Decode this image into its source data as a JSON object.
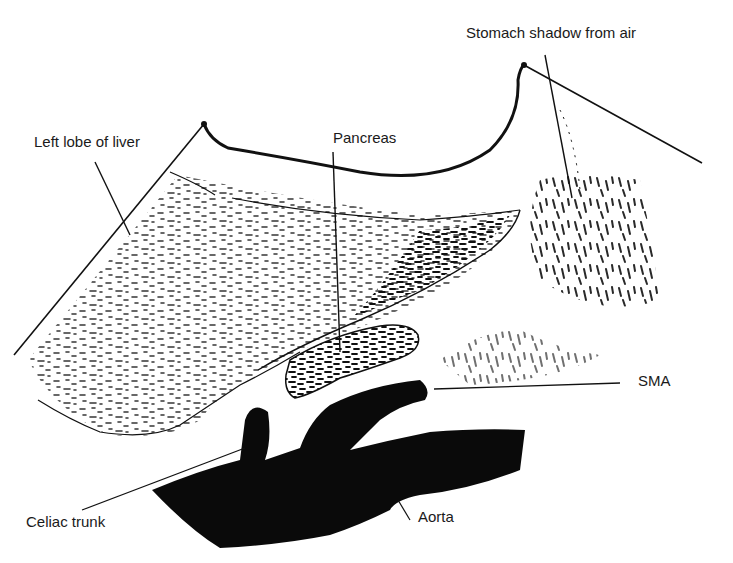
{
  "diagram": {
    "type": "ultrasound-anatomy-sketch",
    "labels": {
      "stomach": "Stomach shadow from air",
      "liver": "Left lobe of liver",
      "pancreas": "Pancreas",
      "sma": "SMA",
      "celiac": "Celiac trunk",
      "aorta": "Aorta"
    },
    "colors": {
      "ink": "#111111",
      "background": "#ffffff"
    }
  }
}
